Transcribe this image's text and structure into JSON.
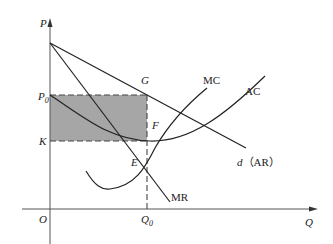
{
  "diagram": {
    "type": "economics-monopoly-profit",
    "colors": {
      "curve": "#222222",
      "axis": "#555555",
      "shaded_area": "#a6a6a6",
      "background": "#ffffff"
    },
    "axes": {
      "y_label": "P",
      "x_label": "Q",
      "origin_label": "O"
    },
    "price_levels": {
      "p0": "P",
      "p0_sub": "0",
      "k": "K"
    },
    "quantity_levels": {
      "q0": "Q",
      "q0_sub": "0"
    },
    "points": {
      "g": "G",
      "f": "F",
      "e": "E"
    },
    "curves": {
      "mc": "MC",
      "ac": "AC",
      "mr": "MR",
      "demand_d": "d",
      "demand_ar": "（AR）"
    },
    "shaded_region": "profit rectangle P0-G-F-K"
  }
}
